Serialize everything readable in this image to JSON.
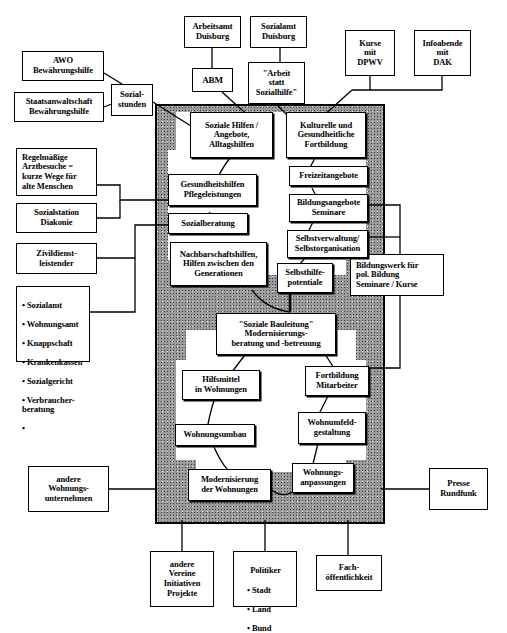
{
  "diagram": {
    "panel": {
      "fill_color": "#9b9b9b",
      "border_color": "#000000"
    }
  },
  "external_nodes": {
    "arbeitsamt_duisburg": "Arbeitsamt\nDuisburg",
    "sozialamt_duisburg": "Sozialamt\nDuisburg",
    "kurse_dpwv": "Kurse\nmit\nDPWV",
    "infoabende_dak": "Infoabende\nmit\nDAK",
    "abm": "ABM",
    "arbeit_statt_sozialhilfe": "\"Arbeit\nstatt\nSozialhilfe\"",
    "awo_bewaehrungshilfe": "AWO\nBewährungshilfe",
    "staatsanwaltschaft": "Staatsanwaltschaft\nBewährungshilfe",
    "sozialstunden": "Sozial-\nstunden",
    "regelmaessige_arztbesuche": "Regelmäßige\nArztbesuche =\nkurze Wege für\nalte Menschen",
    "sozialstation_diakonie": "Sozialstation\nDiakonie",
    "zivildienstleistender": "Zivildienst-\nleistender",
    "aemter_list": {
      "items": [
        "Sozialamt",
        "Wohnungsamt",
        "Knappschaft",
        "Krankenkassen",
        "Sozialgericht",
        "Verbraucher-\n   beratung",
        ""
      ]
    },
    "bildungswerk": "Bildungswerk für\npol. Bildung\nSeminare / Kurse",
    "andere_wohnungsunternehmen": "andere\nWohnungs-\nunternehmen",
    "presse_rundfunk": "Presse\nRundfunk",
    "andere_vereine": "andere\nVereine\nInitiativen\nProjekte",
    "politiker": {
      "header": "Politiker",
      "items": [
        "Stadt",
        "Land",
        "Bund"
      ]
    },
    "fachoeffentlichkeit": "Fach-\nöffentlichkeit"
  },
  "internal_nodes": {
    "soziale_hilfen": "Soziale Hilfen /\nAngebote,\nAlltagshilfen",
    "kulturelle_fortbildung": "Kulturelle und\nGesundheitliche\nFortbildung",
    "gesundheitshilfen": "Gesundheitshilfen\nPflegeleistungen",
    "freizeitangebote": "Freizeitangebote",
    "sozialberatung": "Sozialberatung",
    "bildungsangebote": "Bildungsangebote\nSeminare",
    "nachbarschaftshilfen": "Nachbarschaftshilfen,\nHilfen zwischen den\nGenerationen",
    "selbstverwaltung": "Selbstverwaltung/\nSelbstorganisation",
    "selbsthilfepotentiale": "Selbsthilfe-\npotentiale",
    "soziale_bauleitung": "\"Soziale Bauleitung\"\nModernisierungs-\nberatung und -betreuung",
    "hilfsmittel": "Hilfsmittel\nin Wohnungen",
    "fortbildung_mitarbeiter": "Fortbildung\nMitarbeiter",
    "wohnungsumbau": "Wohnungsumbau",
    "wohnumfeldgestaltung": "Wohnumfeld-\ngestaltung",
    "modernisierung": "Modernisierung\nder Wohnungen",
    "wohnungsanpassungen": "Wohnungs-\nanpassungen"
  }
}
